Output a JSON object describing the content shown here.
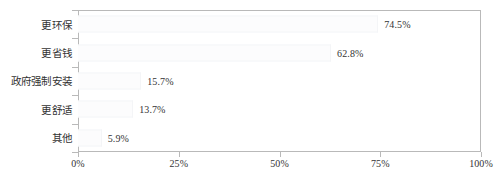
{
  "chart_data": {
    "type": "bar",
    "orientation": "horizontal",
    "title": "",
    "xlabel": "",
    "ylabel": "",
    "categories": [
      "更环保",
      "更省钱",
      "政府强制安装",
      "更舒适",
      "其他"
    ],
    "values": [
      74.5,
      62.8,
      15.7,
      13.7,
      5.9
    ],
    "value_labels": [
      "74.5%",
      "62.8%",
      "15.7%",
      "13.7%",
      "5.9%"
    ],
    "xlim": [
      0,
      100
    ],
    "xticks": [
      0,
      25,
      50,
      75,
      100
    ],
    "xtick_labels": [
      "0%",
      "25%",
      "50%",
      "75%",
      "100%"
    ],
    "grid": false,
    "legend": false,
    "colors": {
      "bar_fill": "#fcfcfd",
      "bar_edge": "#f4f5f7",
      "axis": "#b9b9b9",
      "text": "#333333",
      "background": "#ffffff"
    }
  }
}
